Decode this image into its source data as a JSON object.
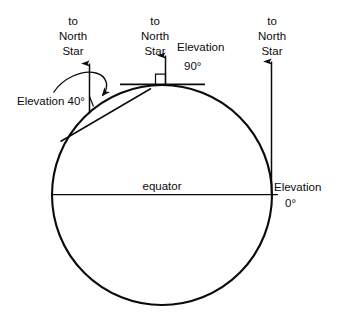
{
  "figure": {
    "type": "diagram",
    "background_color": "#ffffff",
    "stroke_color": "#0b0b0b",
    "earth": {
      "label_equator": "equator",
      "center_x": 162,
      "center_y": 195,
      "radius": 110
    },
    "observers": [
      {
        "id": "observer-40",
        "latitude_deg": 40,
        "elevation_label": "Elevation 40°",
        "star_label_lines": [
          "to",
          "North",
          "Star"
        ],
        "has_curved_angle_arrow": true,
        "has_horizon_tangent": true
      },
      {
        "id": "observer-90",
        "latitude_deg": 90,
        "elevation_label_line1": "Elevation",
        "elevation_label_line2": "90°",
        "star_label_lines": [
          "to",
          "North",
          "Star"
        ],
        "has_right_angle_marker": true,
        "has_horizon_tangent": true
      },
      {
        "id": "observer-0",
        "latitude_deg": 0,
        "elevation_label_line1": "Elevation",
        "elevation_label_line2": "0°",
        "star_label_lines": [
          "to",
          "North",
          "Star"
        ],
        "has_horizon_tangent": true
      }
    ]
  }
}
